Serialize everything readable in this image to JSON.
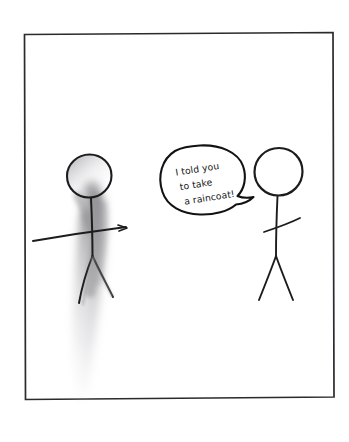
{
  "comic": {
    "title": "Stick figure comic panel",
    "background_color": "#ffffff",
    "ink_color": "#1c1c1e",
    "smudge_color": "#9a9a9e",
    "frame": {
      "name": "panel border",
      "left": 24,
      "top": 33,
      "right": 334,
      "bottom": 399,
      "stroke_color": "#2b2b2f"
    },
    "speech_bubble": {
      "speaker": "right-figure",
      "lines": [
        "I told you",
        "to take",
        "a raincoat!"
      ],
      "full_text": "I told you to take a raincoat!",
      "tail_direction": "right",
      "outline_color": "#121214",
      "fill_color": "#ffffff"
    },
    "figures": [
      {
        "id": "left-figure",
        "label": "melting stick figure",
        "state": "dissolving",
        "head_cx": 89,
        "head_cy": 176,
        "head_r": 22,
        "has_smudge": true,
        "smudge_color": "#a8a8ac"
      },
      {
        "id": "right-figure",
        "label": "speaking stick figure",
        "state": "intact",
        "head_cx": 278,
        "head_cy": 172,
        "head_r": 24,
        "has_smudge": false
      }
    ]
  }
}
